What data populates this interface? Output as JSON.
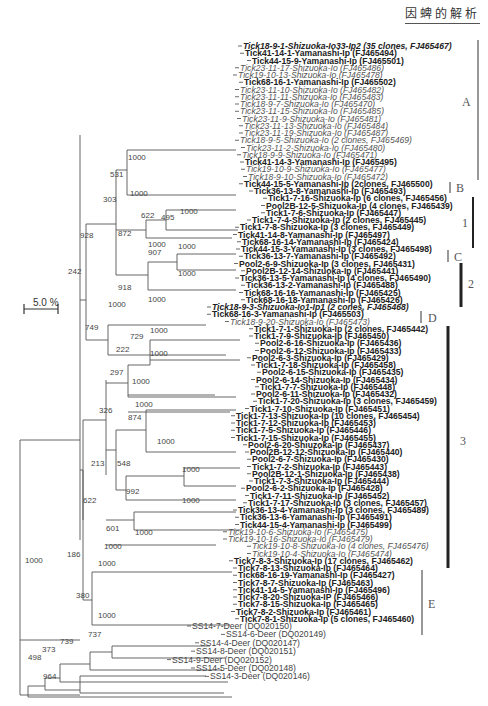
{
  "header": {
    "title": "因蜱的解析"
  },
  "scale_bar": {
    "label": "5.0 %"
  },
  "leaves": [
    {
      "label": "Tick18-9-1-Shizuoka-Io33-Ip2 (35 clones, FJ465467)",
      "style": "bi"
    },
    {
      "label": "Tick41-14-1-Yamanashi-Ip (FJ465494)",
      "style": "b"
    },
    {
      "label": "Tick44-15-9-Yamanashi-Ip (FJ465501)",
      "style": "b"
    },
    {
      "label": "Tick23-11-17-Shizuoka-Io (FJ465486)",
      "style": "i"
    },
    {
      "label": "Tick19-10-13-Shizuoka-Io (FJ465478)",
      "style": "i"
    },
    {
      "label": "Tick68-16-1-Yamanashi-Ip (FJ465502)",
      "style": "b"
    },
    {
      "label": "Tick23-11-10-Shizuoka-Io (FJ465482)",
      "style": "i"
    },
    {
      "label": "Tick23-11-11-Shizuoka-Io (FJ465483)",
      "style": "i"
    },
    {
      "label": "Tick18-9-7-Shizuoka-Io (FJ465470)",
      "style": "i"
    },
    {
      "label": "Tick23-11-15-Shizuoka-Io (FJ465485)",
      "style": "i"
    },
    {
      "label": "Tick23-11-9-Shizuoka-Io (FJ465481)",
      "style": "i"
    },
    {
      "label": "Tick23-11-13-Shizuoka-Io (FJ465484)",
      "style": "i"
    },
    {
      "label": "Tick23-11-19-Shizuoka-Io (FJ465487)",
      "style": "i"
    },
    {
      "label": "Tick18-9-5-Shizuoka-Io (2 clones, FJ465469)",
      "style": "i"
    },
    {
      "label": "Tick23-11-2-Shizuoka-Io (FJ465480)",
      "style": "i"
    },
    {
      "label": "Tick18-9-9-Shizuoka-Io (FJ465471)",
      "style": "i"
    },
    {
      "label": "Tick41-14-3-Yamanashi-Ip (FJ465495)",
      "style": "b"
    },
    {
      "label": "Tick19-10-9-Shizuoka-Io (FJ465477)",
      "style": "i"
    },
    {
      "label": "Tick18-9-10-Shizuoka-Io (FJ465472)",
      "style": "i"
    },
    {
      "label": "Tick44-15-5-Yamanashi-Ip (2clones, FJ465500)",
      "style": "b"
    },
    {
      "label": "Tick36-13-8-Yamanashi-Ip (FJ465493)",
      "style": "b"
    },
    {
      "label": "Tick1-7-16-Shizuoka-Ip (6 clones, FJ465456)",
      "style": "b"
    },
    {
      "label": "Pool2B-12-5-Shizuoka-Ip (4 clones, FJ465439)",
      "style": "b"
    },
    {
      "label": "Tick1-7-6-Shizuoka-Ip (FJ465447)",
      "style": "b"
    },
    {
      "label": "Tick1-7-4-Shizuoka-Ip (2 clones, FJ465445)",
      "style": "b"
    },
    {
      "label": "Tick1-7-8-Shizuoka-Ip (3 clones, FJ465449)",
      "style": "b"
    },
    {
      "label": "Tick41-14-8-Yamanashi-Ip (FJ465497)",
      "style": "b"
    },
    {
      "label": "Tick68-16-14-Yamanashi-Ip (FJ465424)",
      "style": "b"
    },
    {
      "label": "Tick44-15-3-Yamanashi-Ip (3 clones, FJ465498)",
      "style": "b"
    },
    {
      "label": "Tick36-13-7-Yamanashi-Ip (FJ465492)",
      "style": "b"
    },
    {
      "label": "Pool2-6-9-Shizuoka-Ip (3 clones, FJ465431)",
      "style": "b"
    },
    {
      "label": "Pool2B-12-14-Shizuoka-Ip (FJ465441)",
      "style": "b"
    },
    {
      "label": "Tick36-13-5-Yamanashi-Ip (4 clones, FJ465490)",
      "style": "b"
    },
    {
      "label": "Tick36-13-2-Yamanashi-Ip (FJ465488)",
      "style": "b"
    },
    {
      "label": "Tick68-16-16-Yamanashi-Ip (FJ465425)",
      "style": "b"
    },
    {
      "label": "Tick68-16-18-Yamanashi-Ip (FJ465426)",
      "style": "b"
    },
    {
      "label": "Tick18-9-3-Shizuoka-Io1-Ip1 (2 cones, FJ465468)",
      "style": "bi"
    },
    {
      "label": "Tick68-16-3-Yamanashi-Ip (FJ465503)",
      "style": "b"
    },
    {
      "label": "Tick18-9-20-Shizuoka-Io (FJ465473)",
      "style": "i"
    },
    {
      "label": "Tick1-7-1-Shizuoka-Ip (2 clones, FJ465442)",
      "style": "b"
    },
    {
      "label": "Tick1-7-9-Shizuoka-Ip (FJ465450)",
      "style": "b"
    },
    {
      "label": "Pool2-6-16-Shizuoka-Ip (FJ465436)",
      "style": "b"
    },
    {
      "label": "Pool2-6-12-Shizuoka-Ip (FJ465433)",
      "style": "b"
    },
    {
      "label": "Pool2-6-3-Shizuoka-Ip (FJ465429)",
      "style": "b"
    },
    {
      "label": "Tick1-7-18-Shizuoka-Ip (FJ465458)",
      "style": "b"
    },
    {
      "label": "Pool2-6-15-Shizuoka-Ip (FJ465435)",
      "style": "b"
    },
    {
      "label": "Pool2-6-14-Shizuoka-Ip (FJ465434)",
      "style": "b"
    },
    {
      "label": "Tick1-7-7-Shizuoka-Ip (FJ465448)",
      "style": "b"
    },
    {
      "label": "Pool2-6-11-Shizuoka-Ip (FJ465432)",
      "style": "b"
    },
    {
      "label": "Tick1-7-20-Shizuoka-Ip (3 clones, FJ465459)",
      "style": "b"
    },
    {
      "label": "Tick1-7-10-Shizuoka-Ip (FJ465451)",
      "style": "b"
    },
    {
      "label": "Tick1-7-13-Shizuoka-Ip (10 clones, FJ465454)",
      "style": "b"
    },
    {
      "label": "Tick1-7-12-Shizuoka-Ip (FJ465453)",
      "style": "b"
    },
    {
      "label": "Tick1-7-5-Shizuoka-Ip (FJ465446)",
      "style": "b"
    },
    {
      "label": "Tick1-7-15-Shizuoka-Ip (FJ465455)",
      "style": "b"
    },
    {
      "label": "Pool2-6-20-Shiuzoka-Ip (FJ465437)",
      "style": "b"
    },
    {
      "label": "Pool2B-12-12-Shizuoka-Ip (FJ465440)",
      "style": "b"
    },
    {
      "label": "Pool2-6-7-Shizuoka-Ip (FJ465430)",
      "style": "b"
    },
    {
      "label": "Tick1-7-2-Shizuoka-Ip (FJ465443)",
      "style": "b"
    },
    {
      "label": "Pool2B-12-1-Shizuoka-Ip (FJ465438)",
      "style": "b"
    },
    {
      "label": "Tick1-7-3-Shizuoka-Ip (FJ465444)",
      "style": "b"
    },
    {
      "label": "Pool2-6-2-Shizuoka-Ip (FJ465428)",
      "style": "b"
    },
    {
      "label": "Tick1-7-11-Shizuoka-Ip (FJ465452)",
      "style": "b"
    },
    {
      "label": "Tick1-7-17-Shizuoka-Ip (3 clones, FJ465457)",
      "style": "b"
    },
    {
      "label": "Tick36-13-4-Yamanashi-Ip (3 clones, FJ465489)",
      "style": "b"
    },
    {
      "label": "Tick36-13-6-Yamanashi-Ip (FJ465491)",
      "style": "b"
    },
    {
      "label": "Tick44-15-4-Yamanashi-Ip (FJ465499)",
      "style": "b"
    },
    {
      "label": "Tick19-10-6-Shizuoka-Io (FJ465475)",
      "style": "i"
    },
    {
      "label": "Tick19-10-16-Shizuoka-Io (FJ465479)",
      "style": "i"
    },
    {
      "label": "Tick19-10-8-Shizuoka-Io (4 clones, FJ465476)",
      "style": "i"
    },
    {
      "label": "Tick19-10-4-Shizuoka-Io (FJ465474)",
      "style": "i"
    },
    {
      "label": "Tick7-8-3-Shizuoka-Ip (17 clones, FJ465462)",
      "style": "b"
    },
    {
      "label": "Tick7-8-13-Shizuoka-Ip (FJ465464)",
      "style": "b"
    },
    {
      "label": "Tick68-16-19-Yamanashi-Ip (FJ465427)",
      "style": "b"
    },
    {
      "label": "Tick7-8-7-Shizuoka-Ip (FJ465463)",
      "style": "b"
    },
    {
      "label": "Tick41-14-5-Yamanashi-Ip (FJ465496)",
      "style": "b"
    },
    {
      "label": "Tick7-8-20-Shizuoka-IP (FJ465466)",
      "style": "b"
    },
    {
      "label": "Tick7-8-15-Shizuoka-Ip (FJ465465)",
      "style": "b"
    },
    {
      "label": "Tick7-8-2-Shizuoka-Ip (FJ465461)",
      "style": "b"
    },
    {
      "label": "Tick7-8-1-Shizuoka-Ip (5 clones, FJ465460)",
      "style": "b"
    },
    {
      "label": "SS14-7-Deer (DQ020150)",
      "style": "deer"
    },
    {
      "label": "SS14-6-Deer (DQ020149)",
      "style": "deer"
    },
    {
      "label": "SS14-4-Deer (DQ020147)",
      "style": "deer"
    },
    {
      "label": "SS14-8-Deer (DQ020151)",
      "style": "deer"
    },
    {
      "label": "SS14-9-Deer (DQ020152)",
      "style": "deer"
    },
    {
      "label": "SS14-5-Deer (DQ020148)",
      "style": "deer"
    },
    {
      "label": "SS14-3-Deer (DQ020146)",
      "style": "deer"
    }
  ],
  "bootstraps": [
    "1000",
    "531",
    "1000",
    "303",
    "495",
    "1000",
    "622",
    "872",
    "1000",
    "1000",
    "907",
    "928",
    "1000",
    "918",
    "1000",
    "242",
    "1000",
    "749",
    "729",
    "1000",
    "222",
    "1000",
    "297",
    "1000",
    "1000",
    "326",
    "874",
    "1000",
    "213",
    "548",
    "1000",
    "992",
    "1000",
    "622",
    "601",
    "1000",
    "1000",
    "186",
    "1000",
    "1000",
    "380",
    "1000",
    "737",
    "739",
    "373",
    "498",
    "964"
  ],
  "clades": [
    {
      "label": "A",
      "color": "#999999"
    },
    {
      "label": "B",
      "color": "#999999"
    },
    {
      "label": "1",
      "color": "#222222"
    },
    {
      "label": "C",
      "color": "#999999"
    },
    {
      "label": "2",
      "color": "#222222"
    },
    {
      "label": "D",
      "color": "#999999"
    },
    {
      "label": "3",
      "color": "#222222"
    },
    {
      "label": "E",
      "color": "#999999"
    }
  ]
}
